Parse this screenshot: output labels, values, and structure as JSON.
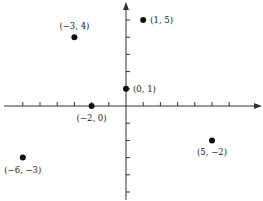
{
  "chart_data": {
    "type": "scatter",
    "title": "",
    "xlabel": "",
    "ylabel": "",
    "xlim": [
      -7,
      7.5
    ],
    "ylim": [
      -5.5,
      6
    ],
    "grid": false,
    "x_ticks": [
      -6,
      -5,
      -4,
      -3,
      -2,
      -1,
      1,
      2,
      3,
      4,
      5,
      6
    ],
    "y_ticks": [
      -5,
      -4,
      -3,
      -2,
      -1,
      1,
      2,
      3,
      4,
      5
    ],
    "points": [
      {
        "x": 1,
        "y": 5,
        "label": "(1, 5)",
        "label_pos": "right"
      },
      {
        "x": -3,
        "y": 4,
        "label": "(−3, 4)",
        "label_pos": "above"
      },
      {
        "x": 0,
        "y": 1,
        "label": "(0, 1)",
        "label_pos": "right"
      },
      {
        "x": -2,
        "y": 0,
        "label": "(−2, 0)",
        "label_pos": "below"
      },
      {
        "x": 5,
        "y": -2,
        "label": "(5, −2)",
        "label_pos": "below"
      },
      {
        "x": -6,
        "y": -3,
        "label": "(−6, −3)",
        "label_pos": "below"
      }
    ]
  },
  "colors": {
    "axis": "#333333",
    "point": "#111111",
    "text": "#222222"
  }
}
